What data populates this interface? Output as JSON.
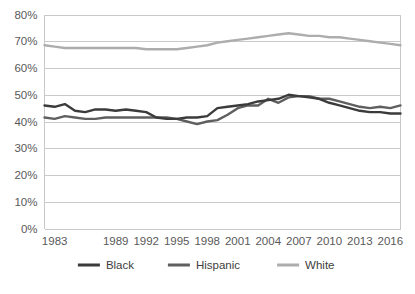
{
  "chart_data": {
    "type": "line",
    "title": "",
    "subtitle": "",
    "xlabel": "",
    "ylabel": "",
    "grid": true,
    "legend_position": "bottom",
    "ylim": [
      0,
      0.8
    ],
    "ytick_labels": [
      "0%",
      "10%",
      "20%",
      "30%",
      "40%",
      "50%",
      "60%",
      "70%",
      "80%"
    ],
    "ytick_values": [
      0,
      10,
      20,
      30,
      40,
      50,
      60,
      70,
      80
    ],
    "xtick_labels": [
      "1983",
      "1989",
      "1992",
      "1995",
      "1998",
      "2001",
      "2004",
      "2007",
      "2010",
      "2013",
      "2016"
    ],
    "xtick_values": [
      1983,
      1989,
      1992,
      1995,
      1998,
      2001,
      2004,
      2007,
      2010,
      2013,
      2016
    ],
    "x": [
      1982,
      1983,
      1984,
      1985,
      1986,
      1987,
      1988,
      1989,
      1990,
      1991,
      1992,
      1993,
      1994,
      1995,
      1996,
      1997,
      1998,
      1999,
      2000,
      2001,
      2002,
      2003,
      2004,
      2005,
      2006,
      2007,
      2008,
      2009,
      2010,
      2011,
      2012,
      2013,
      2014,
      2015,
      2016,
      2017
    ],
    "series": [
      {
        "name": "Black",
        "color": "#3B3B3B",
        "values": [
          46.0,
          45.5,
          46.5,
          44.0,
          43.5,
          44.5,
          44.5,
          44.0,
          44.5,
          44.0,
          43.5,
          41.5,
          41.0,
          41.0,
          41.5,
          41.5,
          42.0,
          45.0,
          45.5,
          46.0,
          46.5,
          47.5,
          48.0,
          48.5,
          50.0,
          49.5,
          49.0,
          48.5,
          47.0,
          46.0,
          45.0,
          44.0,
          43.5,
          43.5,
          43.0,
          43.0
        ]
      },
      {
        "name": "Hispanic",
        "color": "#5F5F5F",
        "values": [
          41.5,
          41.0,
          42.0,
          41.5,
          41.0,
          41.0,
          41.5,
          41.5,
          41.5,
          41.5,
          41.5,
          41.5,
          41.5,
          41.0,
          40.0,
          39.0,
          40.0,
          40.5,
          42.5,
          45.0,
          46.0,
          46.0,
          48.5,
          47.0,
          49.0,
          49.5,
          49.5,
          48.5,
          48.5,
          47.5,
          46.5,
          45.5,
          45.0,
          45.5,
          45.0,
          46.0
        ]
      },
      {
        "name": "White",
        "color": "#ADADAD",
        "values": [
          68.5,
          68.0,
          67.5,
          67.5,
          67.5,
          67.5,
          67.5,
          67.5,
          67.5,
          67.5,
          67.0,
          67.0,
          67.0,
          67.0,
          67.5,
          68.0,
          68.5,
          69.5,
          70.0,
          70.5,
          71.0,
          71.5,
          72.0,
          72.5,
          73.0,
          72.5,
          72.0,
          72.0,
          71.5,
          71.5,
          71.0,
          70.5,
          70.0,
          69.5,
          69.0,
          68.5
        ]
      }
    ],
    "legend": [
      {
        "label": "Black",
        "color": "#3B3B3B"
      },
      {
        "label": "Hispanic",
        "color": "#5F5F5F"
      },
      {
        "label": "White",
        "color": "#ADADAD"
      }
    ]
  }
}
